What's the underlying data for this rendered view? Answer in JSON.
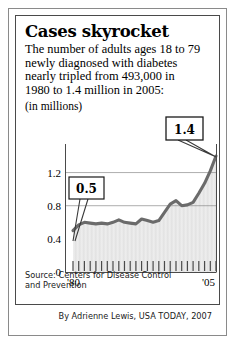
{
  "headline": "Cases skyrocket",
  "deck_lines": [
    "The number of adults ages 18 to 79",
    "newly diagnosed with diabetes",
    "nearly tripled from 493,000 in",
    "1980 to 1.4 million in 2005:"
  ],
  "units_label": "(in millions)",
  "source_lines": [
    "Source: Centers for Disease Control",
    "and Prevention"
  ],
  "credit": "By Adrienne Lewis, USA TODAY, 2007",
  "callouts": [
    {
      "label": "0.5",
      "year": 1980,
      "value": 0.5
    },
    {
      "label": "1.4",
      "year": 2005,
      "value": 1.4
    }
  ],
  "colors": {
    "line": "#6b6b6b",
    "fill_light": "#e9e9e9",
    "fill_dark": "#d8d8d8",
    "gridline": "#808080",
    "axis": "#4a4a4a",
    "text": "#000000",
    "frame_outer": "#8a8a8a",
    "frame_inner": "#4a4a4a"
  },
  "chart_data": {
    "type": "area",
    "title": "Cases skyrocket",
    "subtitle": "The number of adults ages 18 to 79 newly diagnosed with diabetes nearly tripled from 493,000 in 1980 to 1.4 million in 2005:",
    "xlabel": "",
    "ylabel": "(in millions)",
    "ylim": [
      0,
      1.4
    ],
    "xlim": [
      1980,
      2005
    ],
    "ytick_labels": [
      "0",
      "0.4",
      "0.8",
      "1.2"
    ],
    "ytick_values": [
      0,
      0.4,
      0.8,
      1.2
    ],
    "xtick_labels": [
      "'80",
      "'05"
    ],
    "xtick_values": [
      1980,
      2005
    ],
    "grid": true,
    "legend": false,
    "annotations": [
      {
        "text": "0.5",
        "x": 1980,
        "y": 0.5
      },
      {
        "text": "1.4",
        "x": 2005,
        "y": 1.4
      }
    ],
    "x": [
      1980,
      1981,
      1982,
      1983,
      1984,
      1985,
      1986,
      1987,
      1988,
      1989,
      1990,
      1991,
      1992,
      1993,
      1994,
      1995,
      1996,
      1997,
      1998,
      1999,
      2000,
      2001,
      2002,
      2003,
      2004,
      2005
    ],
    "values": [
      0.5,
      0.57,
      0.6,
      0.59,
      0.58,
      0.59,
      0.58,
      0.6,
      0.63,
      0.6,
      0.59,
      0.58,
      0.64,
      0.62,
      0.6,
      0.62,
      0.72,
      0.82,
      0.86,
      0.8,
      0.81,
      0.84,
      0.95,
      1.07,
      1.22,
      1.4
    ],
    "series": [
      {
        "name": "Newly diagnosed diabetes cases (millions)",
        "values": [
          0.5,
          0.57,
          0.6,
          0.59,
          0.58,
          0.59,
          0.58,
          0.6,
          0.63,
          0.6,
          0.59,
          0.58,
          0.64,
          0.62,
          0.6,
          0.62,
          0.72,
          0.82,
          0.86,
          0.8,
          0.81,
          0.84,
          0.95,
          1.07,
          1.22,
          1.4
        ]
      }
    ]
  }
}
